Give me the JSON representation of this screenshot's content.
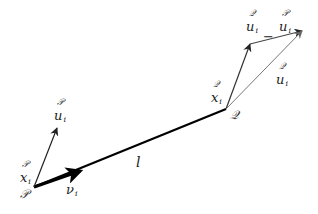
{
  "diagram": {
    "points": {
      "P": {
        "label": "𝒫",
        "x": 34,
        "y": 187
      },
      "Q": {
        "label": "𝒬",
        "x": 226,
        "y": 109
      }
    },
    "vectors": [
      {
        "name": "P-u_i",
        "from": [
          34,
          187
        ],
        "to": [
          57,
          128
        ],
        "color": "#222222",
        "width": 1.2
      },
      {
        "name": "v_i",
        "from": [
          34,
          187
        ],
        "to": [
          80,
          171
        ],
        "color": "#000000",
        "width": 3.2
      },
      {
        "name": "l",
        "from": [
          34,
          187
        ],
        "to": [
          226,
          109
        ],
        "color": "#000000",
        "width": 2.2
      },
      {
        "name": "Q-u_i",
        "from": [
          226,
          109
        ],
        "to": [
          250,
          44
        ],
        "color": "#333333",
        "width": 1.2
      },
      {
        "name": "Q-u_i-minus-P-u_i",
        "from": [
          250,
          44
        ],
        "to": [
          302,
          31
        ],
        "color": "#444444",
        "width": 1.2
      },
      {
        "name": "P-u_i-at-Q",
        "from": [
          226,
          109
        ],
        "to": [
          302,
          31
        ],
        "color": "#777777",
        "width": 1.0
      }
    ],
    "labels": {
      "P_point": "𝒫",
      "Q_point": "𝒬",
      "P_x_i": {
        "super": "𝒫",
        "main": "x",
        "sub": "i"
      },
      "P_u_i": {
        "super": "𝒫",
        "main": "u",
        "sub": "i"
      },
      "v_i": {
        "main": "ν",
        "sub": "i"
      },
      "l": "l",
      "Q_x_i": {
        "super": "𝒬",
        "main": "x",
        "sub": "i"
      },
      "Q_u_i_minus_P_u_i": {
        "super1": "𝒬",
        "main1": "u",
        "sub1": "i",
        "op": "−",
        "super2": "𝒫",
        "main2": "u",
        "sub2": "i"
      },
      "Q_u_i": {
        "super": "𝒬",
        "main": "u",
        "sub": "i"
      }
    }
  }
}
